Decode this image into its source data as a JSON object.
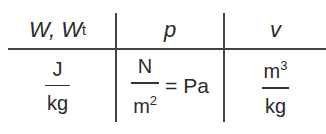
{
  "table": {
    "headers": [
      {
        "symbol": "W, W",
        "subscript": "t"
      },
      {
        "symbol": "p"
      },
      {
        "symbol": "v"
      }
    ],
    "units": [
      {
        "numerator": "J",
        "denominator": "kg"
      },
      {
        "numerator": "N",
        "denominator": "m",
        "denominator_exp": "2",
        "equals": "= Pa"
      },
      {
        "numerator": "m",
        "numerator_exp": "3",
        "denominator": "kg"
      }
    ]
  }
}
